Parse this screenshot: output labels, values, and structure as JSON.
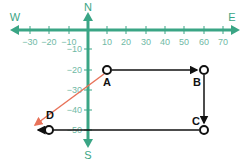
{
  "diagram": {
    "compass": {
      "north": "N",
      "south": "S",
      "east": "E",
      "west": "W"
    },
    "x_ticks": [
      "−30",
      "−20",
      "−10",
      "10",
      "20",
      "30",
      "40",
      "50",
      "60",
      "70"
    ],
    "y_ticks": [
      "−10",
      "−20",
      "−30",
      "−40",
      "−50"
    ],
    "points": {
      "A": {
        "label": "A",
        "x": 10,
        "y": -20
      },
      "B": {
        "label": "B",
        "x": 60,
        "y": -20
      },
      "C": {
        "label": "C",
        "x": 60,
        "y": -50
      },
      "D": {
        "label": "D",
        "x": -30,
        "y": -50
      }
    },
    "paths": [
      {
        "from": "A",
        "to": "B",
        "color": "#111111"
      },
      {
        "from": "B",
        "to": "C",
        "color": "#111111"
      },
      {
        "from": "C",
        "to": "D",
        "color": "#111111"
      },
      {
        "from": "A",
        "to": "D",
        "color": "#e8735a"
      }
    ],
    "colors": {
      "axis": "#3aa585",
      "path": "#111111",
      "resultant": "#e8735a"
    }
  }
}
